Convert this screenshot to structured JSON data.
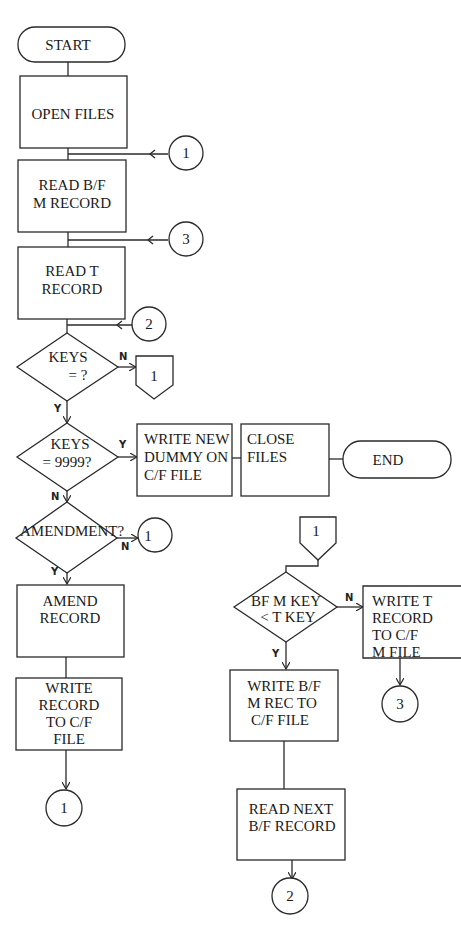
{
  "flowchart": {
    "nodes": {
      "start": "START",
      "open_files": [
        "OPEN FILES"
      ],
      "read_bf_m": [
        "READ B/F",
        "M RECORD"
      ],
      "read_t": [
        "READ T",
        "RECORD"
      ],
      "keys_eq": [
        "KEYS",
        "=  ?"
      ],
      "keys_9999": [
        "KEYS",
        "=  9999?"
      ],
      "write_dummy": [
        "WRITE NEW",
        "DUMMY ON",
        "C/F FILE"
      ],
      "close_files": [
        "CLOSE",
        "FILES"
      ],
      "end": "END",
      "amendment": [
        "AMENDMENT?"
      ],
      "amend_record": [
        "AMEND",
        "RECORD"
      ],
      "write_record": [
        "WRITE",
        "RECORD",
        "TO C/F",
        "FILE"
      ],
      "bf_key_lt": [
        "BF M KEY",
        "< T KEY"
      ],
      "write_t": [
        "WRITE T",
        "RECORD",
        "TO C/F",
        "M FILE"
      ],
      "write_bf": [
        "WRITE B/F",
        "M REC TO",
        "C/F FILE"
      ],
      "read_next": [
        "READ NEXT",
        "B/F RECORD"
      ]
    },
    "connectors": {
      "c1_top": "1",
      "c3_top": "3",
      "c2_top": "2",
      "offpage_keys": "1",
      "c1_amend": "1",
      "offpage_right": "1",
      "c1_bottom": "1",
      "c3_right": "3",
      "c2_bottom": "2"
    },
    "branch_labels": {
      "keys_eq_no": "N",
      "keys_eq_yes": "Y",
      "keys_9999_yes": "Y",
      "keys_9999_no": "N",
      "amend_no": "N",
      "amend_yes": "Y",
      "bf_key_no": "N",
      "bf_key_yes": "Y"
    }
  }
}
